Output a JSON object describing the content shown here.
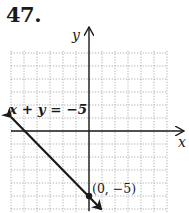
{
  "problem": {
    "number": "47."
  },
  "chart_data": {
    "type": "line",
    "title": "",
    "xlabel": "x",
    "ylabel": "y",
    "xlim": [
      -6,
      6
    ],
    "ylim": [
      -6,
      6
    ],
    "grid": true,
    "grid_style": "dotted",
    "tick_labels": false,
    "series": [
      {
        "name": "x + y = -5",
        "equation": "x + y = -5",
        "x": [
          -6,
          1
        ],
        "y": [
          1,
          -6
        ],
        "arrows": "both"
      }
    ],
    "points": [
      {
        "x": 0,
        "y": -5,
        "label": "(0, −5)"
      }
    ],
    "annotations": [
      {
        "text": "x + y = −5",
        "near": [
          -6,
          1.5
        ]
      },
      {
        "text": "(0, −5)",
        "near": [
          0,
          -5
        ]
      }
    ]
  },
  "labels": {
    "equation": "x + y = −5",
    "point": "(0, −5)",
    "x_axis": "x",
    "y_axis": "y"
  },
  "colors": {
    "grid": "#9a9a9a",
    "axis": "#1a1a1a",
    "line": "#1a1a1a"
  }
}
